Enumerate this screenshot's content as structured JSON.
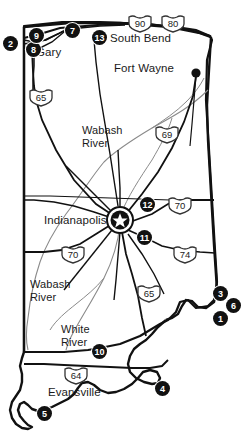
{
  "map": {
    "title": "Indiana State Map",
    "state_outline_color": "#111111",
    "marker_color": "#111111",
    "road_color": "#111111",
    "river_color": "#777777",
    "cities": [
      {
        "name": "South Bend",
        "x": 110,
        "y": 38,
        "dot": false
      },
      {
        "name": "Fort Wayne",
        "x": 114,
        "y": 68,
        "dot": true,
        "dot_x": 196,
        "dot_y": 73
      },
      {
        "name": "Gary",
        "x": 36,
        "y": 52,
        "dot": false
      },
      {
        "name": "Indianapolis",
        "x": 44,
        "y": 220,
        "dot": false
      },
      {
        "name": "Evansville",
        "x": 48,
        "y": 392,
        "dot": false
      }
    ],
    "rivers": [
      {
        "name": "Wabash\nRiver",
        "label_line1": "Wabash",
        "label_line2": "River",
        "x": 82,
        "y": 124
      },
      {
        "name": "Wabash\nRiver",
        "label_line1": "Wabash",
        "label_line2": "River",
        "x": 30,
        "y": 278
      },
      {
        "name": "White\nRiver",
        "label_line1": "White",
        "label_line2": "River",
        "x": 61,
        "y": 323
      }
    ],
    "shields": [
      {
        "route": "90",
        "x": 127,
        "y": 14
      },
      {
        "route": "80",
        "x": 160,
        "y": 14
      },
      {
        "route": "65",
        "x": 28,
        "y": 88
      },
      {
        "route": "69",
        "x": 154,
        "y": 125
      },
      {
        "route": "70",
        "x": 167,
        "y": 196
      },
      {
        "route": "74",
        "x": 172,
        "y": 245
      },
      {
        "route": "70",
        "x": 60,
        "y": 245
      },
      {
        "route": "65",
        "x": 136,
        "y": 284
      },
      {
        "route": "64",
        "x": 63,
        "y": 366
      }
    ],
    "markers": [
      {
        "id": "1",
        "x": 213,
        "y": 311
      },
      {
        "id": "2",
        "x": 8,
        "y": 36
      },
      {
        "id": "3",
        "x": 213,
        "y": 286
      },
      {
        "id": "4",
        "x": 155,
        "y": 381
      },
      {
        "id": "5",
        "x": 37,
        "y": 406
      },
      {
        "id": "6",
        "x": 226,
        "y": 298
      },
      {
        "id": "7",
        "x": 65,
        "y": 23
      },
      {
        "id": "8",
        "x": 28,
        "y": 42
      },
      {
        "id": "9",
        "x": 30,
        "y": 29
      },
      {
        "id": "10",
        "x": 92,
        "y": 344
      },
      {
        "id": "11",
        "x": 137,
        "y": 230
      },
      {
        "id": "12",
        "x": 140,
        "y": 197
      },
      {
        "id": "13",
        "x": 92,
        "y": 30
      }
    ],
    "capital_marker": {
      "name": "Indianapolis",
      "symbol": "star",
      "x": 120,
      "y": 220
    }
  }
}
